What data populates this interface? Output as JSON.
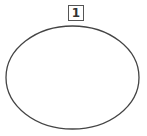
{
  "diagram": {
    "label": "1",
    "shape": {
      "type": "ellipse",
      "stroke": "#444444",
      "fill": "#ffffff"
    }
  }
}
